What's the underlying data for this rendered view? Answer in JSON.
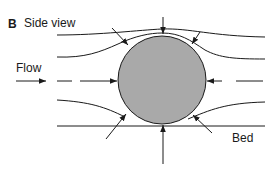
{
  "figure": {
    "panel_letter": "B",
    "panel_title": "Side view",
    "labels": {
      "flow": "Flow",
      "bed": "Bed"
    },
    "colors": {
      "grain_fill": "#a9a9a9",
      "line": "#1a1a1a",
      "background": "#ffffff"
    },
    "elements": {
      "grain": {
        "shape": "circle",
        "description": "grain / particle on bed"
      },
      "streamlines": [
        "upper-outer",
        "upper-inner",
        "center-left-dashed",
        "center-right-dashed",
        "lower",
        "bed-line"
      ],
      "arrows": [
        "top-vertical-down",
        "top-left-diagonal",
        "top-right-diagonal",
        "left-horizontal",
        "right-horizontal",
        "bottom-left-diagonal",
        "bottom-right-diagonal",
        "bottom-vertical-up",
        "flow-arrow"
      ]
    }
  }
}
